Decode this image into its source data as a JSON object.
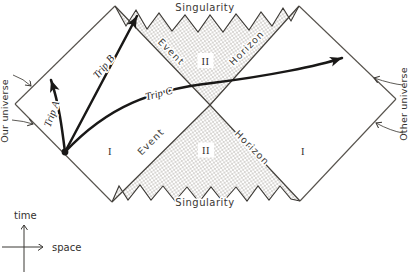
{
  "colors": {
    "paper": "#ffffff",
    "ink": "#2b2926",
    "stipple_dot": "#8c8880"
  },
  "diagram": {
    "singularity_top": "Singularity",
    "singularity_bottom": "Singularity",
    "horizons": {
      "event_top": "Event",
      "horizon_top": "Horizon",
      "event_bottom": "Event",
      "horizon_bottom": "Horizon"
    },
    "regions": {
      "left_I": "I",
      "right_I": "I",
      "top_II": "II",
      "bottom_II": "II"
    },
    "universes": {
      "left": "Our universe",
      "right": "Other universe"
    },
    "trips": {
      "a": {
        "prefix": "Trip",
        "letter": "A"
      },
      "b": {
        "prefix": "Trip",
        "letter": "B"
      },
      "c": {
        "prefix": "Trip",
        "letter": "C"
      }
    },
    "axes": {
      "time": "time",
      "space": "space"
    }
  }
}
